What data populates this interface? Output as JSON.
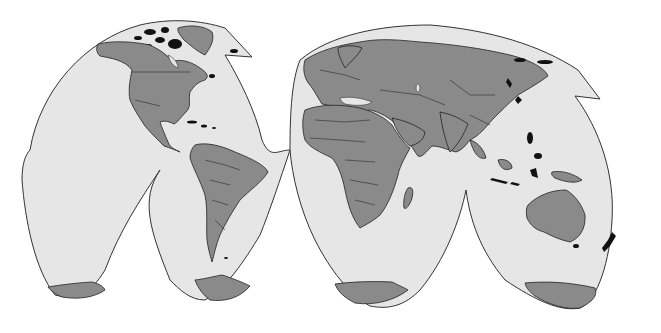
{
  "map": {
    "type": "world-map",
    "projection": "interrupted (two-lobe, butterfly-like)",
    "width": 661,
    "height": 333,
    "colors": {
      "background": "#ffffff",
      "ocean": "#e6e6e6",
      "land": "#8a8a8a",
      "outline": "#222222",
      "islands_highlight": "#111111"
    },
    "lobes": [
      {
        "name": "western-hemisphere-lobe",
        "continents": [
          "North America",
          "South America",
          "Greenland",
          "Antarctica (western segment)"
        ]
      },
      {
        "name": "eastern-hemisphere-lobe",
        "continents": [
          "Europe",
          "Asia",
          "Africa",
          "Australia",
          "Antarctica (eastern segment)"
        ]
      }
    ],
    "features_shown": [
      "country borders",
      "coastlines",
      "Antarctica segments",
      "island chains (dark)"
    ],
    "labels": []
  }
}
